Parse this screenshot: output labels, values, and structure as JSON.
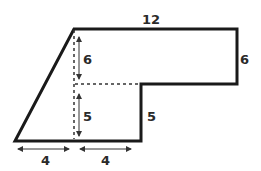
{
  "diagram": {
    "type": "composite-polygon",
    "colors": {
      "outline": "#1a1a1a",
      "dashed": "#333333",
      "arrow": "#333333",
      "text": "#2a2a2a",
      "background": "#ffffff"
    },
    "labels": {
      "top_width": "12",
      "right_height": "6",
      "inner_upper_height": "6",
      "inner_lower_height": "5",
      "step_height": "5",
      "bottom_left_width": "4",
      "bottom_right_width": "4"
    }
  }
}
